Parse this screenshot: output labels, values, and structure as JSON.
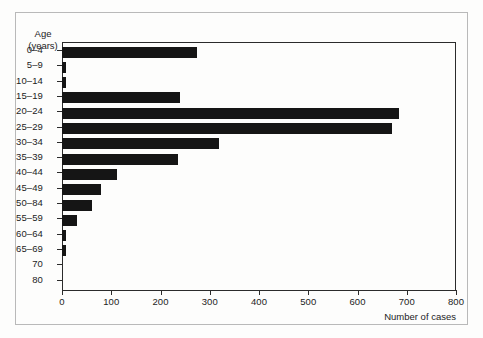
{
  "figure": {
    "axis_header_line1": "Age",
    "axis_header_line2": "(years)",
    "x_axis_title": "Number of cases"
  },
  "chart_data": {
    "type": "bar",
    "orientation": "horizontal",
    "title": "",
    "xlabel": "Number of cases",
    "ylabel": "Age (years)",
    "xlim": [
      0,
      800
    ],
    "xticks": [
      0,
      100,
      200,
      300,
      400,
      500,
      600,
      700,
      800
    ],
    "xtick_labels": [
      "0",
      "100",
      "200",
      "300",
      "400",
      "500",
      "600",
      "700",
      "800"
    ],
    "grid": false,
    "legend": false,
    "bar_color": "#151515",
    "categories": [
      "0–4",
      "5–9",
      "10–14",
      "15–19",
      "20–24",
      "25–29",
      "30–34",
      "35–39",
      "40–44",
      "45–49",
      "50–84",
      "55–59",
      "60–64",
      "65–69",
      "70",
      "80"
    ],
    "values": [
      274,
      9,
      9,
      240,
      684,
      670,
      318,
      235,
      112,
      80,
      60,
      31,
      9,
      8,
      0,
      0
    ]
  }
}
